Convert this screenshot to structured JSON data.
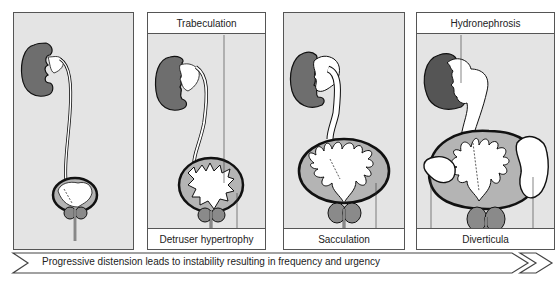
{
  "figure": {
    "type": "anatomical progression diagram"
  },
  "panels": [
    {
      "id": "stage-1",
      "top_label": "",
      "bottom_label": "",
      "annotations": []
    },
    {
      "id": "stage-2",
      "top_label": "Trabeculation",
      "bottom_label": "Detruser hypertrophy",
      "annotations": [
        "Trabeculation",
        "Detruser hypertrophy"
      ]
    },
    {
      "id": "stage-3",
      "top_label": "",
      "bottom_label": "Sacculation",
      "annotations": [
        "Sacculation"
      ]
    },
    {
      "id": "stage-4",
      "top_label": "Hydronephrosis",
      "bottom_label": "Diverticula",
      "annotations": [
        "Hydronephrosis",
        "Diverticula"
      ]
    }
  ],
  "arrow": {
    "text": "Progressive distension leads to instability resulting in frequency and urgency"
  },
  "colors": {
    "kidney_dark": "#6e6e6e",
    "bladder_wall": "#b4b4b4",
    "prostate": "#8a8a8a",
    "background_stipple": "#e4e4e4",
    "outline": "#111111"
  }
}
